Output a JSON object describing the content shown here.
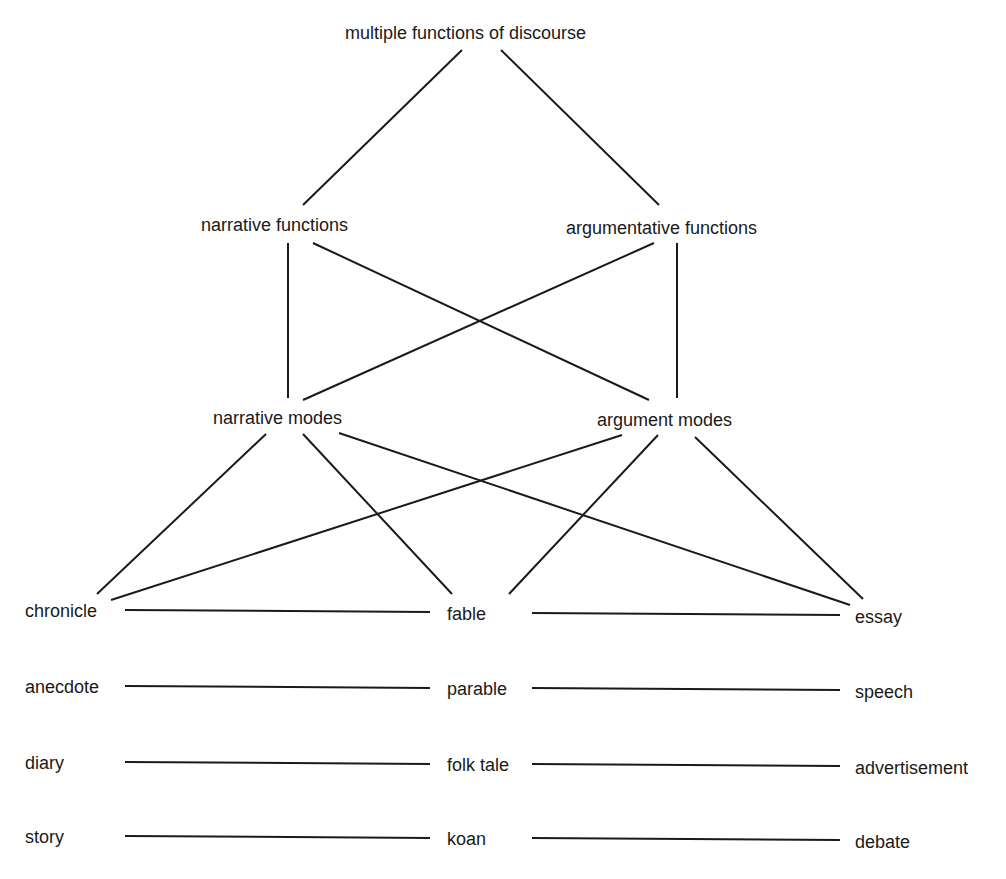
{
  "diagram": {
    "nodes": {
      "root": "multiple functions of discourse",
      "narrative_functions": "narrative functions",
      "argumentative_functions": "argumentative functions",
      "narrative_modes": "narrative modes",
      "argument_modes": "argument modes",
      "chronicle": "chronicle",
      "fable": "fable",
      "essay": "essay",
      "anecdote": "anecdote",
      "parable": "parable",
      "speech": "speech",
      "diary": "diary",
      "folk_tale": "folk tale",
      "advertisement": "advertisement",
      "story": "story",
      "koan": "koan",
      "debate": "debate"
    },
    "edges": [
      [
        "root",
        "narrative_functions"
      ],
      [
        "root",
        "argumentative_functions"
      ],
      [
        "narrative_functions",
        "narrative_modes"
      ],
      [
        "narrative_functions",
        "argument_modes"
      ],
      [
        "argumentative_functions",
        "narrative_modes"
      ],
      [
        "argumentative_functions",
        "argument_modes"
      ],
      [
        "narrative_modes",
        "chronicle"
      ],
      [
        "narrative_modes",
        "fable"
      ],
      [
        "narrative_modes",
        "essay"
      ],
      [
        "argument_modes",
        "chronicle"
      ],
      [
        "argument_modes",
        "fable"
      ],
      [
        "argument_modes",
        "essay"
      ],
      [
        "chronicle",
        "fable"
      ],
      [
        "fable",
        "essay"
      ],
      [
        "anecdote",
        "parable"
      ],
      [
        "parable",
        "speech"
      ],
      [
        "diary",
        "folk_tale"
      ],
      [
        "folk_tale",
        "advertisement"
      ],
      [
        "story",
        "koan"
      ],
      [
        "koan",
        "debate"
      ]
    ]
  }
}
